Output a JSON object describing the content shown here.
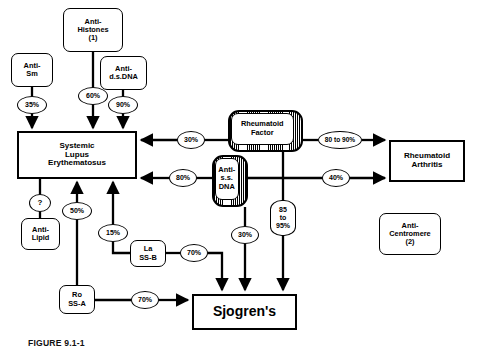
{
  "figure": {
    "caption": "FIGURE 9.1-1",
    "background": "#ffffff",
    "stroke": "#000000"
  },
  "nodes": {
    "anti_histones": {
      "label": "Anti-\nHistones\n(1)",
      "x": 63,
      "y": 8,
      "w": 60,
      "h": 44,
      "shape": "rounded"
    },
    "anti_sm": {
      "label": "Anti-\nSm",
      "x": 11,
      "y": 53,
      "w": 42,
      "h": 34,
      "shape": "rounded"
    },
    "anti_dsdna": {
      "label": "Anti-\nd.s.DNA",
      "x": 100,
      "y": 56,
      "w": 47,
      "h": 34,
      "shape": "rounded"
    },
    "sle": {
      "label": "Systemic\nLupus\nErythematosus",
      "x": 17,
      "y": 131,
      "w": 120,
      "h": 48,
      "shape": "rect"
    },
    "anti_lipid": {
      "label": "Anti-\nLipid",
      "x": 21,
      "y": 218,
      "w": 39,
      "h": 32,
      "shape": "rounded"
    },
    "la_ssb": {
      "label": "La\nSS-B",
      "x": 130,
      "y": 240,
      "w": 36,
      "h": 27,
      "shape": "rounded"
    },
    "ro_ssa": {
      "label": "Ro\nSS-A",
      "x": 59,
      "y": 285,
      "w": 36,
      "h": 29,
      "shape": "rounded"
    },
    "rheumatoid_factor": {
      "label": "Rheumatoid\nFactor",
      "x": 228,
      "y": 110,
      "w": 75,
      "h": 42,
      "shape": "shadow"
    },
    "anti_ssdna": {
      "label": "Anti-\ns.s.\nDNA",
      "x": 212,
      "y": 155,
      "w": 36,
      "h": 52,
      "shape": "shadow"
    },
    "rheumatoid_arthritis": {
      "label": "Rheumatoid\nArthritis",
      "x": 389,
      "y": 140,
      "w": 76,
      "h": 42,
      "shape": "rect"
    },
    "sjogrens": {
      "label": "Sjogren's",
      "x": 192,
      "y": 294,
      "w": 105,
      "h": 36,
      "shape": "rect"
    },
    "anti_centromere": {
      "label": "Anti-\nCentromere\n(2)",
      "x": 379,
      "y": 213,
      "w": 62,
      "h": 42,
      "shape": "rounded"
    }
  },
  "edges": [
    {
      "from": "anti_sm",
      "to": "sle",
      "label": "35%"
    },
    {
      "from": "anti_histones",
      "to": "sle",
      "label": "60%"
    },
    {
      "from": "anti_dsdna",
      "to": "sle",
      "label": "90%"
    },
    {
      "from": "rheumatoid_factor",
      "to": "sle",
      "label": "30%"
    },
    {
      "from": "anti_ssdna",
      "to": "sle",
      "label": "80%"
    },
    {
      "from": "anti_lipid",
      "to": "sle",
      "label": "?"
    },
    {
      "from": "ro_ssa",
      "to": "sle",
      "label": "50%"
    },
    {
      "from": "la_ssb",
      "to": "sle",
      "label": "15%"
    },
    {
      "from": "rheumatoid_factor",
      "to": "rheumatoid_arthritis",
      "label": "80 to 90%"
    },
    {
      "from": "anti_ssdna",
      "to": "rheumatoid_arthritis",
      "label": "40%"
    },
    {
      "from": "la_ssb",
      "to": "sjogrens",
      "label": "70%"
    },
    {
      "from": "ro_ssa",
      "to": "sjogrens",
      "label": "70%"
    },
    {
      "from": "anti_ssdna",
      "to": "sjogrens",
      "label": "30%"
    },
    {
      "from": "rheumatoid_factor",
      "to": "sjogrens",
      "label": "85\nto\n95%"
    }
  ],
  "labels": {
    "p35": "35%",
    "p60": "60%",
    "p90": "90%",
    "p30_rf_sle": "30%",
    "p80_ss_sle": "80%",
    "q_lipid": "?",
    "p50": "50%",
    "p15": "15%",
    "p80to90": "80 to 90%",
    "p40": "40%",
    "p70_la": "70%",
    "p70_ro": "70%",
    "p30_ss_sj": "30%",
    "p85to95": "85\nto\n95%"
  }
}
